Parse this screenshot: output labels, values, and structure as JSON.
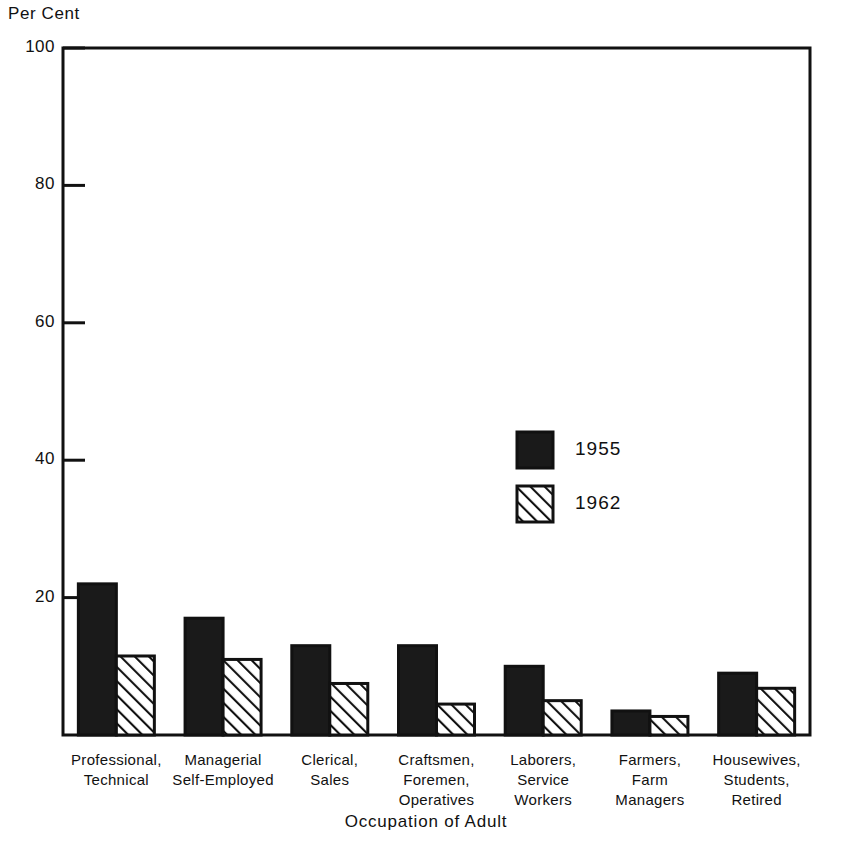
{
  "chart_data": {
    "type": "bar",
    "title": "",
    "xlabel": "Occupation of Adult",
    "ylabel": "Per Cent",
    "ylim": [
      0,
      100
    ],
    "yticks": [
      0,
      20,
      40,
      60,
      80,
      100
    ],
    "ytick_labels": [
      "0",
      "20",
      "40",
      "60",
      "80",
      "100"
    ],
    "grid": false,
    "legend_position": "upper right inside",
    "categories": [
      "Professional, Technical",
      "Managerial Self-Employed",
      "Clerical, Sales",
      "Craftsmen, Foremen, Operatives",
      "Laborers, Service Workers",
      "Farmers, Farm Managers",
      "Housewives, Students, Retired"
    ],
    "category_lines": [
      [
        "Professional,",
        "Technical"
      ],
      [
        "Managerial",
        "Self-Employed"
      ],
      [
        "Clerical,",
        "Sales"
      ],
      [
        "Craftsmen,",
        "Foremen,",
        "Operatives"
      ],
      [
        "Laborers,",
        "Service",
        "Workers"
      ],
      [
        "Farmers,",
        "Farm",
        "Managers"
      ],
      [
        "Housewives,",
        "Students,",
        "Retired"
      ]
    ],
    "series": [
      {
        "name": "1955",
        "pattern": "solid-black",
        "color": "#1a1a1a",
        "values": [
          22,
          17,
          13,
          13,
          10,
          3.5,
          9
        ]
      },
      {
        "name": "1962",
        "pattern": "diagonal-hatch",
        "color": "#ffffff",
        "values": [
          11.5,
          11,
          7.5,
          4.5,
          5,
          2.7,
          6.8
        ]
      }
    ]
  },
  "axis": {
    "ylabel_title": "Per Cent",
    "xlabel_title": "Occupation of Adult"
  },
  "legend": {
    "entries": [
      {
        "label": "1955",
        "pattern": "solid-black"
      },
      {
        "label": "1962",
        "pattern": "diagonal-hatch"
      }
    ]
  },
  "colors": {
    "ink": "#111111",
    "bar_fill_1955": "#1a1a1a",
    "bar_fill_1962": "#ffffff",
    "hatch_stroke": "#111111",
    "background": "#ffffff"
  }
}
